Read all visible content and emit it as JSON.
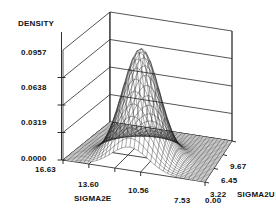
{
  "figure": {
    "kind": "3d-surface-plot",
    "background": "#ffffff",
    "ink": "#111111"
  },
  "chart_data": {
    "type": "line",
    "render_as": "3d-wireframe-surface",
    "title": "",
    "zlabel": "DENSITY",
    "xlabel": "SIGMA2E",
    "ylabel": "SIGMA2U",
    "z_ticks": [
      "0.0000",
      "0.0319",
      "0.0638",
      "0.0957"
    ],
    "z_values": [
      0.0,
      0.0319,
      0.0638,
      0.0957
    ],
    "zlim": [
      0.0,
      0.1276
    ],
    "x_ticks": [
      "16.63",
      "13.60",
      "10.56",
      "7.53",
      "0.00"
    ],
    "x_values": [
      16.63,
      13.6,
      10.56,
      7.53,
      0.0
    ],
    "xlim": [
      0.0,
      16.63
    ],
    "y_ticks": [
      "0.00",
      "3.22",
      "6.45",
      "9.67"
    ],
    "y_values": [
      0.0,
      3.22,
      6.45,
      9.67
    ],
    "ylim": [
      0.0,
      9.67
    ],
    "grid": true,
    "legend": null,
    "peak": {
      "density": 0.1276,
      "sigma2e": 11.0,
      "sigma2u": 1.9
    },
    "surface": {
      "mesh_nx": 34,
      "mesh_ny": 34,
      "peak_z_frac": 1.0,
      "sx": 0.13,
      "sy": 0.17,
      "cx": 0.47,
      "cy": 0.3
    }
  },
  "labels": {
    "density": "DENSITY",
    "sigma2e": "SIGMA2E",
    "sigma2u": "SIGMA2U",
    "z0": "0.0000",
    "z1": "0.0319",
    "z2": "0.0638",
    "z3": "0.0957",
    "x0": "16.63",
    "x1": "13.60",
    "x2": "10.56",
    "x3": "7.53",
    "x4": "0.00",
    "y1": "3.22",
    "y2": "6.45",
    "y3": "9.67"
  }
}
